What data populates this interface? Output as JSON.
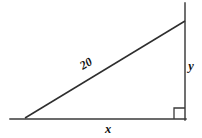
{
  "figure": {
    "background_color": "#ffffff",
    "line_color": "#3a3a3a",
    "label_color": "#111111",
    "width": 202,
    "height": 138
  },
  "labels": {
    "hypotenuse": "20",
    "vertical_leg": "y",
    "horizontal_leg": "x"
  },
  "geometry": {
    "left_vertex": "25,118",
    "bottom_right_vertex": "185,119",
    "top_right_vertex": "185,21",
    "base_line": "10,119 186,119",
    "vertical_line": "185,3 185,120",
    "hypotenuse_line": "25,118 185,21",
    "right_angle_square": "174,108 185,108 185,119 174,119"
  },
  "label_positions": {
    "hypotenuse_x": 88,
    "hypotenuse_y": 67,
    "hypotenuse_rotation": -31,
    "vertical_leg_x": 191,
    "vertical_leg_y": 70,
    "horizontal_leg_x": 108,
    "horizontal_leg_y": 133
  }
}
